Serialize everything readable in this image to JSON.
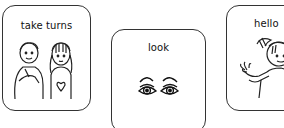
{
  "cards": [
    {
      "label": "take turns",
      "icon": "two-children-icon"
    },
    {
      "label": "look",
      "icon": "eyes-icon"
    },
    {
      "label": "hello",
      "icon": "waving-girl-icon"
    }
  ],
  "colors": {
    "stroke": "#333333",
    "background": "#ffffff"
  }
}
